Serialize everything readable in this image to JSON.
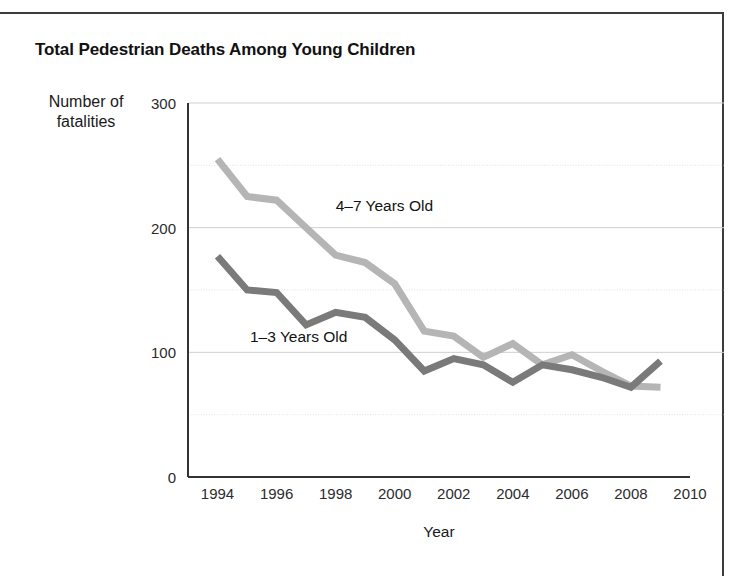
{
  "chart_data": {
    "type": "line",
    "title": "Total Pedestrian Deaths Among Young Children",
    "xlabel": "Year",
    "ylabel": "Number of fatalities",
    "ylabel_line1": "Number of",
    "ylabel_line2": "fatalities",
    "xlim": [
      1993,
      2010
    ],
    "ylim": [
      0,
      300
    ],
    "yticks": [
      0,
      100,
      200,
      300
    ],
    "ytick_labels": [
      "0",
      "100",
      "200",
      "300"
    ],
    "y_minor_gridlines": [
      50,
      150,
      250
    ],
    "xticks": [
      1994,
      1996,
      1998,
      2000,
      2002,
      2004,
      2006,
      2008,
      2010
    ],
    "xtick_labels": [
      "1994",
      "1996",
      "1998",
      "2000",
      "2002",
      "2004",
      "2006",
      "2008",
      "2010"
    ],
    "grid": true,
    "legend_position": "inline-annotations",
    "x": [
      1994,
      1995,
      1996,
      1997,
      1998,
      1999,
      2000,
      2001,
      2002,
      2003,
      2004,
      2005,
      2006,
      2007,
      2008,
      2009
    ],
    "series": [
      {
        "name": "4–7 Years Old",
        "color": "#b5b5b5",
        "values": [
          255,
          225,
          222,
          200,
          178,
          172,
          155,
          117,
          113,
          96,
          107,
          90,
          98,
          85,
          73,
          72
        ]
      },
      {
        "name": "1–3 Years Old",
        "color": "#7a7a7a",
        "values": [
          177,
          150,
          148,
          122,
          132,
          128,
          110,
          85,
          95,
          90,
          76,
          90,
          86,
          80,
          72,
          93
        ]
      }
    ],
    "annotations": [
      {
        "text": "4–7 Years Old",
        "x": 1998,
        "y": 213
      },
      {
        "text": "1–3 Years Old",
        "x": 1995.1,
        "y": 108
      }
    ]
  }
}
